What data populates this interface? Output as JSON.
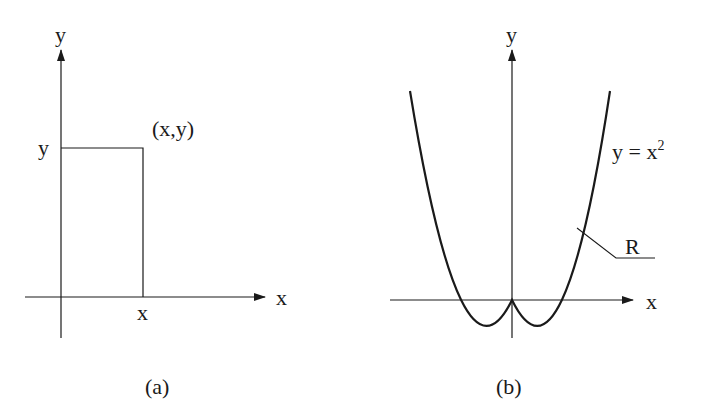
{
  "panels": [
    {
      "id": "a",
      "caption": "(a)",
      "x_axis_label": "x",
      "y_axis_label": "y",
      "point_label": "(x,y)",
      "x_tick_label": "x",
      "y_tick_label": "y",
      "shape": "rectangle"
    },
    {
      "id": "b",
      "caption": "(b)",
      "x_axis_label": "x",
      "y_axis_label": "y",
      "curve_label_main": "y = x",
      "curve_label_exp": "2",
      "region_label": "R",
      "curve": "parabola"
    }
  ],
  "colors": {
    "ink": "#1a1a1a",
    "background": "#ffffff"
  }
}
